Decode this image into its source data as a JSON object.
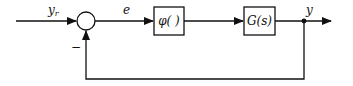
{
  "diagram": {
    "type": "feedback-control-block-diagram",
    "signals": {
      "reference": "y",
      "reference_sub": "r",
      "error": "e",
      "output": "y",
      "feedback_sign": "−"
    },
    "blocks": [
      {
        "id": "nonlinearity",
        "label": "φ( )"
      },
      {
        "id": "plant",
        "label": "G(s)"
      }
    ],
    "connections": [
      {
        "from": "input",
        "to": "summing-junction",
        "label": "y_r"
      },
      {
        "from": "summing-junction",
        "to": "nonlinearity",
        "label": "e"
      },
      {
        "from": "nonlinearity",
        "to": "plant",
        "label": ""
      },
      {
        "from": "plant",
        "to": "output",
        "label": "y"
      },
      {
        "from": "output",
        "to": "summing-junction",
        "label": "−",
        "type": "negative-feedback"
      }
    ],
    "colors": {
      "stroke": "#111111",
      "background": "#ffffff"
    }
  }
}
